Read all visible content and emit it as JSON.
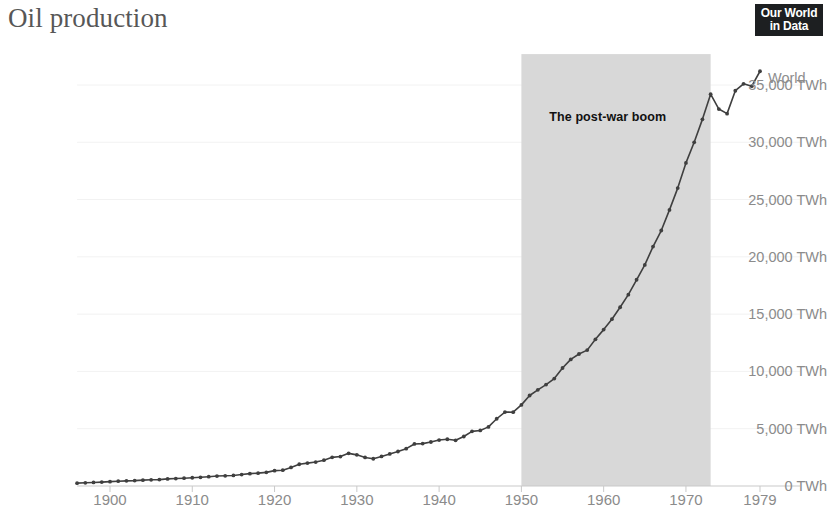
{
  "header": {
    "title": "Oil production",
    "logo_line1": "Our World",
    "logo_line2": "in Data"
  },
  "colors": {
    "line": "#3f3f3f",
    "band": "#d8d8d8",
    "axis_text": "#8b8b8b",
    "title_text": "#575757",
    "annotation_text": "#111111",
    "grid": "#f2f2f2",
    "logo_bg": "#1d1f21"
  },
  "chart_data": {
    "type": "line",
    "title": "Oil production",
    "xlabel": "",
    "ylabel": "",
    "yunit": "TWh",
    "xlim": [
      1896,
      1979
    ],
    "ylim": [
      0,
      37000
    ],
    "grid": true,
    "legend_position": "line-end",
    "y_ticks": [
      0,
      5000,
      10000,
      15000,
      20000,
      25000,
      30000,
      35000
    ],
    "y_tick_labels": [
      "0 TWh",
      "5,000 TWh",
      "10,000 TWh",
      "15,000 TWh",
      "20,000 TWh",
      "25,000 TWh",
      "30,000 TWh",
      "35,000 TWh"
    ],
    "x_ticks": [
      1900,
      1910,
      1920,
      1930,
      1940,
      1950,
      1960,
      1970,
      1979
    ],
    "x_tick_labels": [
      "1900",
      "1910",
      "1920",
      "1930",
      "1940",
      "1950",
      "1960",
      "1970",
      "1979"
    ],
    "annotations": [
      {
        "text": "The post-war boom",
        "type": "band",
        "x_start": 1950,
        "x_end": 1973,
        "label_x": 1960.5,
        "label_y": 32200
      }
    ],
    "series": [
      {
        "name": "World",
        "markers": true,
        "x": [
          1896,
          1897,
          1898,
          1899,
          1900,
          1901,
          1902,
          1903,
          1904,
          1905,
          1906,
          1907,
          1908,
          1909,
          1910,
          1911,
          1912,
          1913,
          1914,
          1915,
          1916,
          1917,
          1918,
          1919,
          1920,
          1921,
          1922,
          1923,
          1924,
          1925,
          1926,
          1927,
          1928,
          1929,
          1930,
          1931,
          1932,
          1933,
          1934,
          1935,
          1936,
          1937,
          1938,
          1939,
          1940,
          1941,
          1942,
          1943,
          1944,
          1945,
          1946,
          1947,
          1948,
          1949,
          1950,
          1951,
          1952,
          1953,
          1954,
          1955,
          1956,
          1957,
          1958,
          1959,
          1960,
          1961,
          1962,
          1963,
          1964,
          1965,
          1966,
          1967,
          1968,
          1969,
          1970,
          1971,
          1972,
          1973,
          1974,
          1975,
          1976,
          1977,
          1978,
          1979
        ],
        "values": [
          250,
          280,
          310,
          340,
          380,
          420,
          450,
          470,
          510,
          540,
          560,
          620,
          650,
          680,
          720,
          760,
          810,
          870,
          890,
          920,
          1000,
          1080,
          1120,
          1190,
          1340,
          1380,
          1620,
          1900,
          2000,
          2090,
          2250,
          2500,
          2570,
          2850,
          2720,
          2490,
          2380,
          2580,
          2800,
          3010,
          3260,
          3670,
          3700,
          3840,
          4010,
          4080,
          3990,
          4320,
          4770,
          4850,
          5160,
          5870,
          6450,
          6440,
          7080,
          7900,
          8390,
          8850,
          9380,
          10300,
          11050,
          11520,
          11860,
          12800,
          13650,
          14560,
          15600,
          16700,
          18000,
          19300,
          20900,
          22300,
          24100,
          26000,
          28200,
          30000,
          32000,
          34200,
          32900,
          32500,
          34500,
          35100,
          34900,
          36200
        ]
      }
    ]
  }
}
